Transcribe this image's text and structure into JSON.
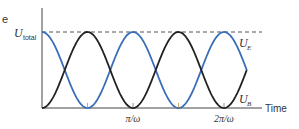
{
  "chart_data": {
    "type": "line",
    "title": "",
    "panel_label": "e",
    "xlabel": "Time",
    "ylabel": "",
    "y_reference": {
      "label": "U",
      "subscript": "total",
      "style": "dashed",
      "value": 1.0
    },
    "x_ticks": [
      {
        "label": "π/ω",
        "value": 1
      },
      {
        "label": "2π/ω",
        "value": 2
      }
    ],
    "x_range": [
      0,
      2.25
    ],
    "ylim": [
      0,
      1
    ],
    "grid": false,
    "series": [
      {
        "name": "U_E",
        "label_main": "U",
        "label_sub": "E",
        "color": "#3a6fb8",
        "function": "U_total·cos²(ωt)",
        "x": [
          0,
          0.5,
          1,
          1.5,
          2,
          2.25
        ],
        "values": [
          1,
          0,
          1,
          0,
          1,
          0.5
        ]
      },
      {
        "name": "U_B",
        "label_main": "U",
        "label_sub": "B",
        "color": "#222222",
        "function": "U_total·sin²(ωt)",
        "x": [
          0,
          0.5,
          1,
          1.5,
          2,
          2.25
        ],
        "values": [
          0,
          1,
          0,
          1,
          0,
          0.5
        ]
      }
    ]
  }
}
